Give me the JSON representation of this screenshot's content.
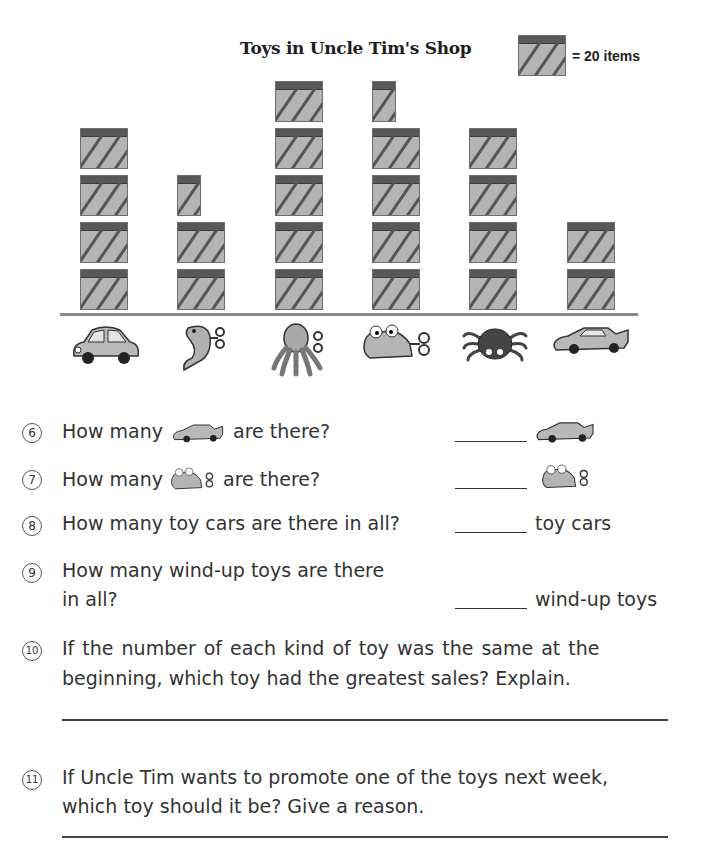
{
  "chart_data": {
    "type": "bar",
    "subtype": "pictograph",
    "title": "Toys in Uncle Tim's Shop",
    "legend": {
      "symbol": "striped-box",
      "label": "= 20 items",
      "value_per_symbol": 20
    },
    "categories": [
      "toy car",
      "wind-up fish",
      "wind-up octopus",
      "wind-up frog",
      "toy spider",
      "race car"
    ],
    "symbols": [
      4,
      2.5,
      5,
      4.5,
      4,
      2
    ],
    "values": [
      80,
      50,
      100,
      90,
      80,
      40
    ],
    "xlabel": "",
    "ylabel": "",
    "grid": false
  },
  "title": "Toys in Uncle Tim's Shop",
  "legend_label": "= 20 items",
  "toys": [
    {
      "name": "toy car",
      "icon": "car-icon"
    },
    {
      "name": "wind-up fish",
      "icon": "fish-icon"
    },
    {
      "name": "wind-up octopus",
      "icon": "octopus-icon"
    },
    {
      "name": "wind-up frog",
      "icon": "frog-icon"
    },
    {
      "name": "toy spider",
      "icon": "spider-icon"
    },
    {
      "name": "race car",
      "icon": "race-car-icon"
    }
  ],
  "questions": [
    {
      "num": "6",
      "pre": "How many",
      "post": "are there?",
      "icon": "race-car-icon",
      "answer_suffix_icon": "race-car-icon"
    },
    {
      "num": "7",
      "pre": "How many",
      "post": "are there?",
      "icon": "frog-icon",
      "answer_suffix_icon": "frog-icon"
    },
    {
      "num": "8",
      "text": "How many toy cars are there in all?",
      "answer_suffix": "toy cars"
    },
    {
      "num": "9",
      "line1": "How many wind-up toys are there",
      "line2": "in all?",
      "answer_suffix": "wind-up toys"
    },
    {
      "num": "10",
      "line1": "If the number of each kind of toy was the same at the",
      "line2": "beginning, which toy had the greatest sales?  Explain."
    },
    {
      "num": "11",
      "line1": "If Uncle Tim wants to promote one of the toys next week,",
      "line2": "which toy should it be?  Give a reason."
    }
  ]
}
